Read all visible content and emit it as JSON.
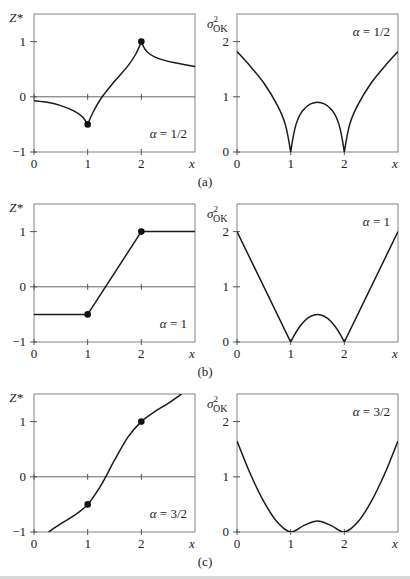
{
  "figure": {
    "panel_captions": [
      "(a)",
      "(b)",
      "(c)"
    ]
  },
  "chart_data": [
    {
      "type": "line",
      "panel": "(a) left",
      "title": "",
      "ylabel": "Z*",
      "xlabel": "x",
      "annotation": "α = 1/2",
      "xlim": [
        0,
        3
      ],
      "ylim": [
        -1,
        1.5
      ],
      "xticks": [
        "0",
        "1",
        "2"
      ],
      "yticks": [
        "−1",
        "0",
        "1"
      ],
      "grid": false,
      "x": [
        0,
        0.25,
        0.5,
        0.75,
        0.9,
        1.0,
        1.1,
        1.27,
        1.5,
        1.75,
        1.9,
        2.0,
        2.1,
        2.3,
        2.6,
        3.0
      ],
      "values": [
        -0.07,
        -0.1,
        -0.16,
        -0.26,
        -0.36,
        -0.5,
        -0.28,
        0.0,
        0.28,
        0.56,
        0.78,
        1.0,
        0.82,
        0.7,
        0.62,
        0.55
      ],
      "data_points": [
        {
          "x": 1,
          "y": -0.5
        },
        {
          "x": 2,
          "y": 1
        }
      ]
    },
    {
      "type": "line",
      "panel": "(a) right",
      "ylabel": "σ²_OK",
      "xlabel": "x",
      "annotation": "α = 1/2",
      "xlim": [
        0,
        3
      ],
      "ylim": [
        0,
        2.5
      ],
      "xticks": [
        "0",
        "1",
        "2"
      ],
      "yticks": [
        "0",
        "1",
        "2"
      ],
      "x": [
        0,
        0.25,
        0.5,
        0.75,
        0.9,
        1.0,
        1.1,
        1.25,
        1.5,
        1.75,
        1.9,
        2.0,
        2.1,
        2.25,
        2.5,
        2.75,
        3.0
      ],
      "values": [
        1.82,
        1.55,
        1.25,
        0.85,
        0.5,
        0.0,
        0.5,
        0.78,
        0.9,
        0.78,
        0.5,
        0.0,
        0.5,
        0.85,
        1.25,
        1.55,
        1.82
      ]
    },
    {
      "type": "line",
      "panel": "(b) left",
      "ylabel": "Z*",
      "xlabel": "x",
      "annotation": "α = 1",
      "xlim": [
        0,
        3
      ],
      "ylim": [
        -1,
        1.5
      ],
      "xticks": [
        "0",
        "1",
        "2"
      ],
      "yticks": [
        "−1",
        "0",
        "1"
      ],
      "x": [
        0,
        1,
        2,
        3
      ],
      "values": [
        -0.5,
        -0.5,
        1.0,
        1.0
      ],
      "data_points": [
        {
          "x": 1,
          "y": -0.5
        },
        {
          "x": 2,
          "y": 1
        }
      ]
    },
    {
      "type": "line",
      "panel": "(b) right",
      "ylabel": "σ²_OK",
      "xlabel": "x",
      "annotation": "α = 1",
      "xlim": [
        0,
        3
      ],
      "ylim": [
        0,
        2.5
      ],
      "xticks": [
        "0",
        "1",
        "2"
      ],
      "yticks": [
        "0",
        "1",
        "2"
      ],
      "x": [
        0,
        1,
        1.25,
        1.5,
        1.75,
        2,
        3
      ],
      "values": [
        2.0,
        0.0,
        0.375,
        0.5,
        0.375,
        0.0,
        2.0
      ]
    },
    {
      "type": "line",
      "panel": "(c) left",
      "ylabel": "Z*",
      "xlabel": "x",
      "annotation": "α = 3/2",
      "xlim": [
        0,
        3
      ],
      "ylim": [
        -1,
        1.5
      ],
      "xticks": [
        "0",
        "1",
        "2"
      ],
      "yticks": [
        "−1",
        "0",
        "1"
      ],
      "x": [
        0.27,
        0.5,
        0.75,
        1.0,
        1.25,
        1.5,
        1.75,
        2.0,
        2.25,
        2.5,
        2.75
      ],
      "values": [
        -1.0,
        -0.85,
        -0.7,
        -0.5,
        -0.15,
        0.3,
        0.72,
        1.0,
        1.18,
        1.33,
        1.5
      ],
      "data_points": [
        {
          "x": 1,
          "y": -0.5
        },
        {
          "x": 2,
          "y": 1
        }
      ]
    },
    {
      "type": "line",
      "panel": "(c) right",
      "ylabel": "σ²_OK",
      "xlabel": "x",
      "annotation": "α = 3/2",
      "xlim": [
        0,
        3
      ],
      "ylim": [
        0,
        2.5
      ],
      "xticks": [
        "0",
        "1",
        "2"
      ],
      "yticks": [
        "0",
        "1",
        "2"
      ],
      "x": [
        0,
        0.25,
        0.5,
        0.75,
        1.0,
        1.25,
        1.5,
        1.75,
        2.0,
        2.25,
        2.5,
        2.75,
        3.0
      ],
      "values": [
        1.65,
        1.05,
        0.55,
        0.18,
        0.0,
        0.12,
        0.2,
        0.12,
        0.0,
        0.18,
        0.55,
        1.05,
        1.65
      ]
    }
  ]
}
